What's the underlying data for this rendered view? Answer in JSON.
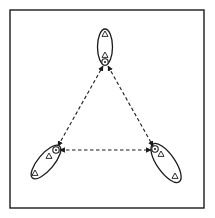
{
  "diagram": {
    "type": "network",
    "frame": {
      "x": 10,
      "y": 10,
      "width": 194,
      "height": 198
    },
    "colors": {
      "ink": "#1a1a1a",
      "background": "#ffffff"
    },
    "clusters": [
      {
        "id": "top",
        "ellipse": {
          "cx": 105,
          "cy": 47,
          "rx": 7.5,
          "ry": 18,
          "rotate": 0
        },
        "members": [
          {
            "shape": "triangle",
            "x": 105,
            "y": 34
          },
          {
            "shape": "triangle",
            "x": 105,
            "y": 55
          }
        ],
        "leader": {
          "shape": "circle",
          "x": 105,
          "y": 62
        }
      },
      {
        "id": "bottom-left",
        "ellipse": {
          "cx": 46,
          "cy": 162,
          "rx": 8,
          "ry": 21,
          "rotate": 40
        },
        "members": [
          {
            "shape": "triangle",
            "x": 49,
            "y": 156
          },
          {
            "shape": "triangle",
            "x": 35,
            "y": 173
          }
        ],
        "leader": {
          "shape": "circle",
          "x": 56,
          "y": 150
        }
      },
      {
        "id": "bottom-right",
        "ellipse": {
          "cx": 166,
          "cy": 163,
          "rx": 9,
          "ry": 23,
          "rotate": -35
        },
        "members": [
          {
            "shape": "triangle",
            "x": 161,
            "y": 154
          },
          {
            "shape": "triangle",
            "x": 175,
            "y": 176
          }
        ],
        "leader": {
          "shape": "circle",
          "x": 155,
          "y": 149
        }
      }
    ],
    "links": [
      {
        "from": "bottom-left",
        "to": "top",
        "style": "dashed",
        "arrows": "both",
        "x1": 58,
        "y1": 146,
        "x2": 103,
        "y2": 66
      },
      {
        "from": "top",
        "to": "bottom-right",
        "style": "dashed",
        "arrows": "both",
        "x1": 108,
        "y1": 66,
        "x2": 153,
        "y2": 146
      },
      {
        "from": "bottom-left",
        "to": "bottom-right",
        "style": "dashed",
        "arrows": "both",
        "x1": 60,
        "y1": 150,
        "x2": 151,
        "y2": 150
      }
    ]
  }
}
